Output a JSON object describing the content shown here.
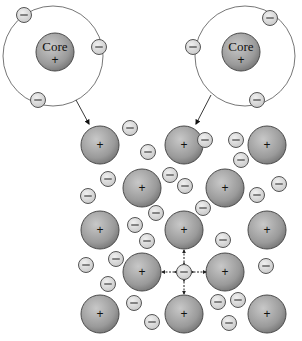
{
  "diagram": {
    "type": "metallic-bonding-illustration",
    "atoms": [
      {
        "id": "atom-left",
        "core_label": "Core",
        "core_charge": "+",
        "orbit": {
          "cx": 53,
          "cy": 56,
          "r": 50
        },
        "core": {
          "cx": 55,
          "cy": 52,
          "r": 19
        },
        "electrons": [
          {
            "cx": 24,
            "cy": 15
          },
          {
            "cx": 99,
            "cy": 47
          },
          {
            "cx": 38,
            "cy": 100
          }
        ],
        "arrow": {
          "x1": 76,
          "y1": 100,
          "x2": 89,
          "y2": 124
        }
      },
      {
        "id": "atom-right",
        "core_label": "Core",
        "core_charge": "+",
        "orbit": {
          "cx": 245,
          "cy": 56,
          "r": 50
        },
        "core": {
          "cx": 241,
          "cy": 52,
          "r": 19
        },
        "electrons": [
          {
            "cx": 270,
            "cy": 18
          },
          {
            "cx": 193,
            "cy": 47
          },
          {
            "cx": 257,
            "cy": 100
          }
        ],
        "arrow": {
          "x1": 211,
          "y1": 95,
          "x2": 196,
          "y2": 124
        }
      }
    ],
    "lattice_cores": {
      "charge": "+",
      "r": 19,
      "positions": [
        {
          "cx": 100,
          "cy": 145
        },
        {
          "cx": 184,
          "cy": 145
        },
        {
          "cx": 267,
          "cy": 145
        },
        {
          "cx": 142,
          "cy": 188
        },
        {
          "cx": 225,
          "cy": 188
        },
        {
          "cx": 100,
          "cy": 230
        },
        {
          "cx": 184,
          "cy": 230
        },
        {
          "cx": 267,
          "cy": 230
        },
        {
          "cx": 142,
          "cy": 272
        },
        {
          "cx": 225,
          "cy": 272
        },
        {
          "cx": 100,
          "cy": 314
        },
        {
          "cx": 184,
          "cy": 314
        },
        {
          "cx": 267,
          "cy": 314
        }
      ]
    },
    "free_electrons": {
      "charge": "−",
      "r": 7.5,
      "positions": [
        {
          "cx": 130,
          "cy": 128
        },
        {
          "cx": 148,
          "cy": 152
        },
        {
          "cx": 108,
          "cy": 179
        },
        {
          "cx": 170,
          "cy": 175
        },
        {
          "cx": 185,
          "cy": 186
        },
        {
          "cx": 88,
          "cy": 196
        },
        {
          "cx": 156,
          "cy": 213
        },
        {
          "cx": 135,
          "cy": 225
        },
        {
          "cx": 236,
          "cy": 140
        },
        {
          "cx": 205,
          "cy": 140
        },
        {
          "cx": 241,
          "cy": 160
        },
        {
          "cx": 279,
          "cy": 184
        },
        {
          "cx": 203,
          "cy": 208
        },
        {
          "cx": 257,
          "cy": 195
        },
        {
          "cx": 147,
          "cy": 241
        },
        {
          "cx": 86,
          "cy": 265
        },
        {
          "cx": 116,
          "cy": 259
        },
        {
          "cx": 108,
          "cy": 284
        },
        {
          "cx": 134,
          "cy": 303
        },
        {
          "cx": 152,
          "cy": 322
        },
        {
          "cx": 223,
          "cy": 240
        },
        {
          "cx": 266,
          "cy": 266
        },
        {
          "cx": 218,
          "cy": 302
        },
        {
          "cx": 238,
          "cy": 300
        },
        {
          "cx": 229,
          "cy": 323
        }
      ]
    },
    "highlighted_electron": {
      "cx": 184,
      "cy": 272,
      "r": 7.5,
      "attraction_arrows": [
        "left",
        "right",
        "up",
        "down"
      ]
    },
    "colors": {
      "core_fill_light": "#c4c4c4",
      "core_fill_dark": "#7a7a7a",
      "electron_fill": "#e2e2e2",
      "stroke": "#555555",
      "orbit": "#666666"
    }
  }
}
